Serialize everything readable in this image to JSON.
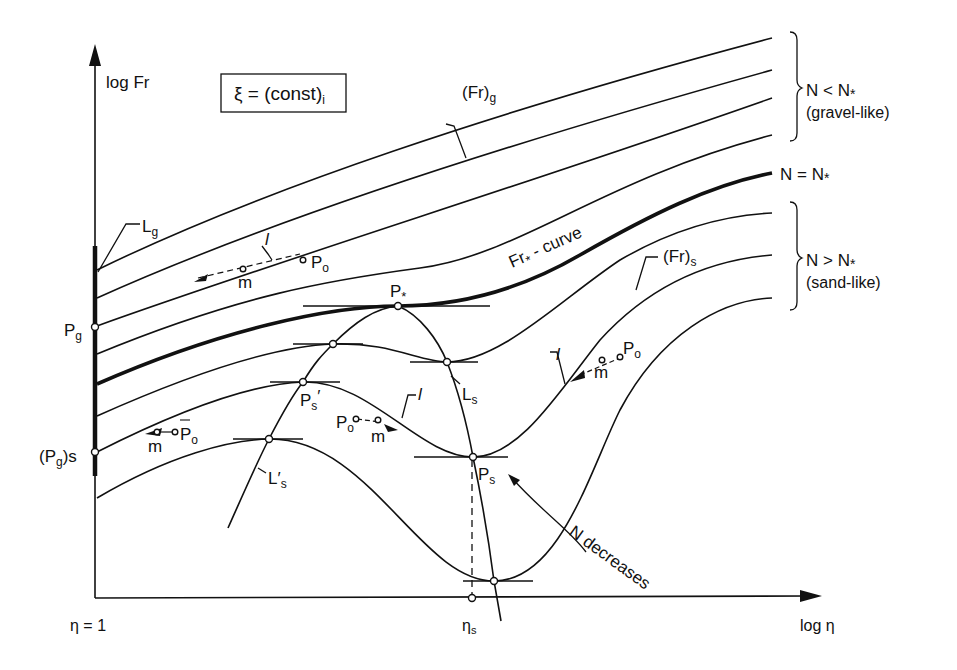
{
  "diagram": {
    "title_box": "ξ = (const)",
    "title_box_sub": "i",
    "axes": {
      "y_label": "log Fr",
      "x_label": "log η",
      "x_origin_label": "η = 1",
      "x_mark_label": "η",
      "x_mark_sub": "s"
    },
    "groups": {
      "gravel": {
        "line1": "N < N",
        "sub": "*",
        "line2": "(gravel-like)"
      },
      "critical": {
        "text": "N = N",
        "sub": "*"
      },
      "sand": {
        "line1": "N > N",
        "sub": "*",
        "line2": "(sand-like)"
      }
    },
    "curve_labels": {
      "fr_g": "(Fr)",
      "fr_g_sub": "g",
      "fr_s": "(Fr)",
      "fr_s_sub": "s",
      "fr_star": "Fr",
      "fr_star_rest": " - curve",
      "fr_star_sub": "*"
    },
    "points": {
      "p_g": "P",
      "p_g_sub": "g",
      "pg_s": "(P",
      "pg_s_sub": "g",
      "pg_s_end": ")s",
      "p_star": "P",
      "p_star_sub": "*",
      "p_s": "P",
      "p_s_sub": "s",
      "p_s_prime": "P",
      "p_s_prime_sub": "s",
      "p_o": "P",
      "p_o_sub": "o",
      "m": "m",
      "l": "l"
    },
    "loci": {
      "l_g": "L",
      "l_g_sub": "g",
      "l_s": "L",
      "l_s_sub": "s",
      "l_s_prime": "L′",
      "l_s_prime_sub": "s"
    },
    "annotation": "N decreases"
  }
}
